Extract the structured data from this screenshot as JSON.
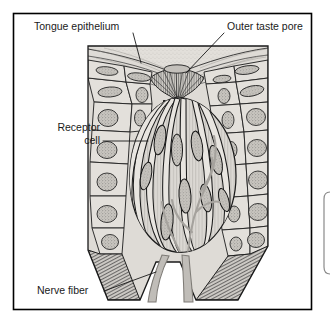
{
  "figure": {
    "kind": "anatomical-illustration",
    "style": "grayscale halftone line drawing",
    "frame": {
      "border_color": "#000000",
      "background": "#ffffff"
    }
  },
  "labels": [
    {
      "id": "tongue-epithelium",
      "text": "Tongue epithelium",
      "align": "left",
      "x": 34,
      "y": 30
    },
    {
      "id": "outer-taste-pore",
      "text": "Outer taste pore",
      "align": "left",
      "x": 227,
      "y": 30
    },
    {
      "id": "receptor-cell-1",
      "text": "Receptor",
      "align": "right",
      "x": 100,
      "y": 131
    },
    {
      "id": "receptor-cell-2",
      "text": "cell",
      "align": "right",
      "x": 100,
      "y": 144
    },
    {
      "id": "nerve-fiber",
      "text": "Nerve fiber",
      "align": "left",
      "x": 37,
      "y": 294
    }
  ],
  "colors": {
    "ink": "#1a1a1a",
    "tissue_fill": "#d8d5d0",
    "tissue_fill_light": "#e6e3de",
    "cell_outline": "#2b2b2b",
    "nucleus_fill": "#bdbab4",
    "nerve_fiber": "#b5b2ad",
    "hatching": "#3a3a3a",
    "page_background": "#ffffff",
    "frame_border": "#000000"
  },
  "structures": [
    {
      "id": "tongue-epithelium",
      "name": "Tongue epithelium",
      "description": "stratified surface layer of polygonal cells with oval nuclei"
    },
    {
      "id": "outer-taste-pore",
      "name": "Outer taste pore",
      "description": "funnel-shaped opening at the surface with converging microvilli"
    },
    {
      "id": "taste-bud",
      "name": "Taste bud",
      "description": "barrel-shaped cluster of elongated spindle cells"
    },
    {
      "id": "receptor-cell",
      "name": "Receptor cell",
      "description": "elongated taste receptor cell with dark oval nucleus"
    },
    {
      "id": "nerve-fiber",
      "name": "Nerve fiber",
      "description": "two gray nerve fibers descending from the base of the taste bud"
    },
    {
      "id": "cut-edge",
      "name": "Cut tissue edge",
      "description": "dense hatching along the lower sectioned border"
    }
  ]
}
